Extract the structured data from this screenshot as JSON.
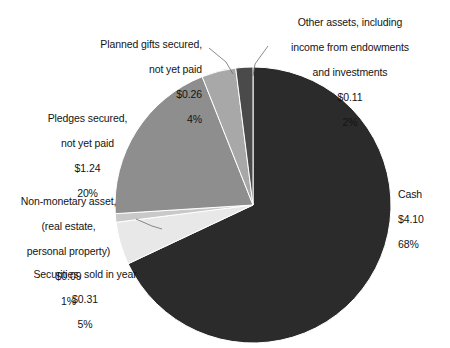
{
  "chart_data": {
    "type": "pie",
    "title": "",
    "subtitle": "",
    "xlabel": "",
    "ylabel": "",
    "units": "billions of dollars",
    "legend_position": "none",
    "grid": false,
    "labels_outside": true,
    "total_value": "6.11",
    "categories": [
      "Cash",
      "Pledges secured, not yet paid",
      "Securities, sold in year",
      "Planned gifts secured, not yet paid",
      "Other assets, including income from endowments and investments",
      "Non-monetary asset, (real estate, personal property)"
    ],
    "values": [
      4.1,
      1.24,
      0.31,
      0.26,
      0.11,
      0.09
    ],
    "percents": [
      68,
      20,
      5,
      4,
      2,
      1
    ],
    "colors": [
      "#2b2b2b",
      "#8e8e8e",
      "#e8e8e8",
      "#a8a8a8",
      "#4a4a4a",
      "#c9c9c9"
    ],
    "slices": [
      {
        "id": "cash",
        "name": "Cash",
        "value_label": "$4.10",
        "percent_label": "68%",
        "value": 4.1,
        "percent": 68,
        "color": "#2b2b2b",
        "start_angle": 0,
        "end_angle": 244.8
      },
      {
        "id": "pledges",
        "name": "Pledges secured,\nnot yet paid",
        "value_label": "$1.24",
        "percent_label": "20%",
        "value": 1.24,
        "percent": 20,
        "color": "#8e8e8e",
        "start_angle": 280.8,
        "end_angle": 352.8
      },
      {
        "id": "securities",
        "name": "Securities, sold in year",
        "value_label": "$0.31",
        "percent_label": "5%",
        "value": 0.31,
        "percent": 5,
        "color": "#e8e8e8",
        "start_angle": 244.8,
        "end_angle": 262.8
      },
      {
        "id": "planned-gifts",
        "name": "Planned gifts secured,\nnot yet paid",
        "value_label": "$0.26",
        "percent_label": "4%",
        "value": 0.26,
        "percent": 4,
        "color": "#a8a8a8",
        "start_angle": 352.8,
        "end_angle": 367.2
      },
      {
        "id": "other-assets",
        "name": "Other assets, including\nincome from endowments\nand investments",
        "value_label": "$0.11",
        "percent_label": "2%",
        "value": 0.11,
        "percent": 2,
        "color": "#4a4a4a",
        "start_angle": 352.8,
        "end_angle": 360
      },
      {
        "id": "non-monetary",
        "name": "Non-monetary asset,\n(real estate,\npersonal property)",
        "value_label": "$0.09",
        "percent_label": "1%",
        "value": 0.09,
        "percent": 1,
        "color": "#c9c9c9",
        "start_angle": 262.8,
        "end_angle": 266.4
      }
    ]
  },
  "labels": {
    "planned_gifts": {
      "line1": "Planned gifts secured,",
      "line2": "not yet paid",
      "value": "$0.26",
      "percent": "4%"
    },
    "other_assets": {
      "line1": "Other assets, including",
      "line2": "income from endowments",
      "line3": "and investments",
      "value": "$0.11",
      "percent": "2%"
    },
    "pledges": {
      "line1": "Pledges secured,",
      "line2": "not yet paid",
      "value": "$1.24",
      "percent": "20%"
    },
    "non_monetary": {
      "line1": "Non-monetary asset,",
      "line2": "(real estate,",
      "line3": "personal property)",
      "value": "$0.09",
      "percent": "1%"
    },
    "securities": {
      "line1": "Securities, sold in year",
      "value": "$0.31",
      "percent": "5%"
    },
    "cash": {
      "line1": "Cash",
      "value": "$4.10",
      "percent": "68%"
    }
  }
}
